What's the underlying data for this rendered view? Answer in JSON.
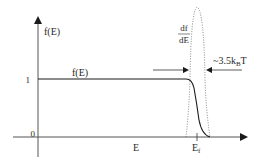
{
  "diagram": {
    "y_axis_label": "f(E)",
    "x_axis_label": "E",
    "fermi_label_main": "E",
    "fermi_label_sub": "f",
    "tick_one": "1",
    "tick_zero": "0",
    "curve_label": "f(E)",
    "derivative_num": "df",
    "derivative_den": "dE",
    "width_label_prefix": "~3.5k",
    "width_label_sub": "B",
    "width_label_suffix": "T",
    "colors": {
      "axis": "#3a3a3a",
      "curve": "#1a1a1a",
      "dotted": "#6a6a6a",
      "text": "#2a2a2a"
    }
  }
}
